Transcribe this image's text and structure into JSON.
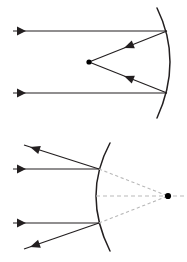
{
  "figure": {
    "background_color": "#ffffff",
    "ray_color": "#231f20",
    "virtual_ray_color": "#b9b9b9",
    "focus_color": "#000000",
    "width": 187,
    "height": 262,
    "panels": [
      {
        "id": "concave-mirror-panel",
        "label": "Concave mirror converging parallel rays to focal point",
        "mirror_type": "concave",
        "mirror_vertex": {
          "x": 170,
          "y": 62
        },
        "mirror_arc_top": {
          "x": 157,
          "y": 8
        },
        "mirror_arc_bottom": {
          "x": 157,
          "y": 118
        },
        "focal_point": {
          "x": 89,
          "y": 62
        },
        "incident_rays": [
          {
            "name": "incident-ray-upper",
            "start": {
              "x": 13,
              "y": 31
            },
            "end": {
              "x": 167,
              "y": 31
            },
            "arrow_at": {
              "x": 26,
              "y": 31
            },
            "direction": "right"
          },
          {
            "name": "incident-ray-lower",
            "start": {
              "x": 13,
              "y": 93
            },
            "end": {
              "x": 167,
              "y": 93
            },
            "arrow_at": {
              "x": 26,
              "y": 93
            },
            "direction": "right"
          }
        ],
        "reflected_rays": [
          {
            "name": "reflected-ray-upper",
            "start": {
              "x": 167,
              "y": 31
            },
            "end": {
              "x": 89,
              "y": 62
            },
            "arrow_at": {
              "x": 124,
              "y": 48
            },
            "direction": "toward-focus"
          },
          {
            "name": "reflected-ray-lower",
            "start": {
              "x": 167,
              "y": 93
            },
            "end": {
              "x": 89,
              "y": 62
            },
            "arrow_at": {
              "x": 124,
              "y": 76
            },
            "direction": "toward-focus"
          }
        ]
      },
      {
        "id": "convex-mirror-panel",
        "label": "Convex mirror diverging parallel rays from virtual focal point",
        "mirror_type": "convex",
        "mirror_vertex": {
          "x": 96,
          "y": 196
        },
        "mirror_arc_top": {
          "x": 110,
          "y": 143
        },
        "mirror_arc_bottom": {
          "x": 110,
          "y": 251
        },
        "focal_point": {
          "x": 168,
          "y": 196
        },
        "incident_rays": [
          {
            "name": "incident-ray-upper",
            "start": {
              "x": 13,
              "y": 169
            },
            "end": {
              "x": 99,
              "y": 169
            },
            "arrow_at": {
              "x": 26,
              "y": 169
            },
            "direction": "right"
          },
          {
            "name": "incident-ray-lower",
            "start": {
              "x": 13,
              "y": 223
            },
            "end": {
              "x": 99,
              "y": 223
            },
            "arrow_at": {
              "x": 26,
              "y": 223
            },
            "direction": "right"
          }
        ],
        "reflected_rays": [
          {
            "name": "reflected-ray-upper",
            "start": {
              "x": 99,
              "y": 169
            },
            "end": {
              "x": 24,
              "y": 145
            },
            "arrow_at": {
              "x": 30,
              "y": 147
            },
            "direction": "up-left"
          },
          {
            "name": "reflected-ray-lower",
            "start": {
              "x": 99,
              "y": 223
            },
            "end": {
              "x": 24,
              "y": 249
            },
            "arrow_at": {
              "x": 30,
              "y": 247
            },
            "direction": "down-left"
          }
        ],
        "virtual_rays": [
          {
            "name": "virtual-ray-upper",
            "start": {
              "x": 99,
              "y": 169
            },
            "end": {
              "x": 168,
              "y": 196
            }
          },
          {
            "name": "virtual-ray-lower",
            "start": {
              "x": 99,
              "y": 223
            },
            "end": {
              "x": 168,
              "y": 196
            }
          },
          {
            "name": "virtual-ray-axis",
            "start": {
              "x": 96,
              "y": 196
            },
            "end": {
              "x": 186,
              "y": 196
            }
          }
        ]
      }
    ]
  }
}
